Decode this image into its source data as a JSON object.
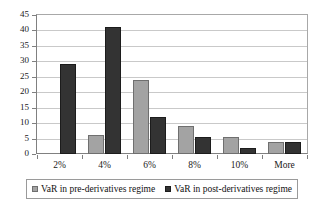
{
  "chart_data": {
    "type": "bar",
    "title": "",
    "subtitle": "",
    "xlabel": "",
    "ylabel": "",
    "categories": [
      "2%",
      "4%",
      "6%",
      "8%",
      "10%",
      "More"
    ],
    "series": [
      {
        "name": "VaR in pre-derivatives regime",
        "color": "#a3a3a3",
        "values": [
          0,
          6,
          24,
          9,
          5.5,
          4
        ]
      },
      {
        "name": "VaR in post-derivatives regime",
        "color": "#333333",
        "values": [
          29,
          41,
          12,
          5.5,
          2,
          4
        ]
      }
    ],
    "ylim": [
      0,
      45
    ],
    "ytick_step": 5,
    "ytick_labels": [
      "45",
      "40",
      "35",
      "30",
      "25",
      "20",
      "15",
      "10",
      "5",
      "0"
    ],
    "grid": true,
    "grid_axis": "y",
    "legend_position": "bottom"
  },
  "legend": {
    "entries": [
      {
        "label": "VaR in pre-derivatives regime"
      },
      {
        "label": "VaR in post-derivatives regime"
      }
    ]
  },
  "colors": {
    "pre_series": "#a3a3a3",
    "post_series": "#333333",
    "gridline": "#c9c9c9",
    "axis": "#808080",
    "text": "#1a1a1a",
    "background": "#ffffff"
  }
}
